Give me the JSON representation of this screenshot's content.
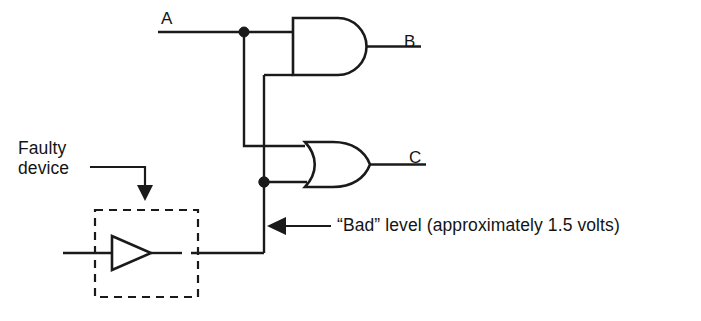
{
  "figure": {
    "type": "logic-circuit-diagram",
    "background_color": "#ffffff",
    "line_color": "#1a1a1a"
  },
  "signals": {
    "input_a": "A",
    "output_b": "B",
    "output_c": "C"
  },
  "gates": [
    {
      "id": "and-gate",
      "type": "AND",
      "output_signal": "B",
      "inputs": 2
    },
    {
      "id": "or-gate",
      "type": "OR",
      "output_signal": "C",
      "inputs": 2
    },
    {
      "id": "buffer-gate",
      "type": "BUFFER",
      "inputs": 1,
      "enclosed_by": "faulty-device-box"
    }
  ],
  "callouts": {
    "faulty_device": {
      "line1": "Faulty",
      "line2": "device",
      "points_to": "buffer-gate"
    },
    "bad_level": {
      "text": "“Bad” level (approximately 1.5 volts)",
      "points_to": "buffer-output-node"
    }
  },
  "nodes": [
    {
      "id": "node-a-tap",
      "x": 244,
      "y": 32
    },
    {
      "id": "node-bad-level",
      "x": 264,
      "y": 182
    }
  ]
}
